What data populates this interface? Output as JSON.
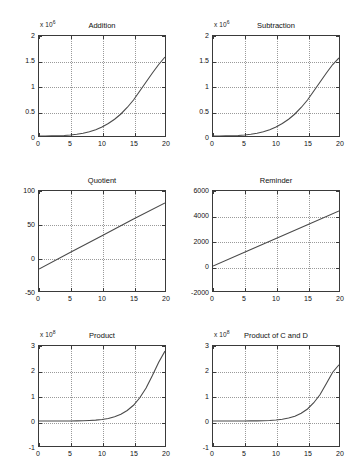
{
  "figure": {
    "background": "#ffffff",
    "axis_color": "#3a3a3a",
    "grid_color": "#9a9a9a",
    "curve_color": "#4a4a4a",
    "rows": 3,
    "cols": 2
  },
  "chart_data": [
    {
      "type": "line",
      "title": "Addition",
      "exponent_prefix": "x 10",
      "exponent_power": "6",
      "xlabel": "",
      "ylabel": "",
      "xlim": [
        0,
        20
      ],
      "ylim": [
        0,
        2
      ],
      "xticks": [
        "0",
        "5",
        "10",
        "15",
        "20"
      ],
      "xtick_values": [
        0,
        5,
        10,
        15,
        20
      ],
      "yticks": [
        "0",
        "0.5",
        "1",
        "1.5",
        "2"
      ],
      "ytick_values": [
        0,
        0.5,
        1,
        1.5,
        2
      ],
      "grid": true,
      "legend": "none",
      "x": [
        0,
        1,
        2,
        3,
        4,
        5,
        6,
        7,
        8,
        9,
        10,
        11,
        12,
        13,
        14,
        15,
        16,
        17,
        18,
        19,
        20
      ],
      "values": [
        0,
        0.0005,
        0.002,
        0.005,
        0.011,
        0.02,
        0.035,
        0.056,
        0.085,
        0.125,
        0.18,
        0.25,
        0.335,
        0.44,
        0.57,
        0.72,
        0.9,
        1.08,
        1.26,
        1.43,
        1.58
      ]
    },
    {
      "type": "line",
      "title": "Subtraction",
      "exponent_prefix": "x 10",
      "exponent_power": "6",
      "xlabel": "",
      "ylabel": "",
      "xlim": [
        0,
        20
      ],
      "ylim": [
        0,
        2
      ],
      "xticks": [
        "0",
        "5",
        "10",
        "15",
        "20"
      ],
      "xtick_values": [
        0,
        5,
        10,
        15,
        20
      ],
      "yticks": [
        "0",
        "0.5",
        "1",
        "1.5",
        "2"
      ],
      "ytick_values": [
        0,
        0.5,
        1,
        1.5,
        2
      ],
      "grid": true,
      "legend": "none",
      "x": [
        0,
        1,
        2,
        3,
        4,
        5,
        6,
        7,
        8,
        9,
        10,
        11,
        12,
        13,
        14,
        15,
        16,
        17,
        18,
        19,
        20
      ],
      "values": [
        0,
        0.0005,
        0.002,
        0.005,
        0.011,
        0.02,
        0.035,
        0.056,
        0.085,
        0.125,
        0.18,
        0.25,
        0.335,
        0.44,
        0.57,
        0.72,
        0.9,
        1.08,
        1.26,
        1.43,
        1.56
      ]
    },
    {
      "type": "line",
      "title": "Quotient",
      "exponent_prefix": "",
      "exponent_power": "",
      "xlabel": "",
      "ylabel": "",
      "xlim": [
        0,
        20
      ],
      "ylim": [
        -50,
        100
      ],
      "xticks": [
        "0",
        "5",
        "10",
        "15",
        "20"
      ],
      "xtick_values": [
        0,
        5,
        10,
        15,
        20
      ],
      "yticks": [
        "-50",
        "0",
        "50",
        "100"
      ],
      "ytick_values": [
        -50,
        0,
        50,
        100
      ],
      "grid": true,
      "legend": "none",
      "x": [
        0,
        5,
        10,
        15,
        20
      ],
      "values": [
        -17,
        8,
        33,
        58,
        82
      ]
    },
    {
      "type": "line",
      "title": "Reminder",
      "exponent_prefix": "",
      "exponent_power": "",
      "xlabel": "",
      "ylabel": "",
      "xlim": [
        0,
        20
      ],
      "ylim": [
        -2000,
        6000
      ],
      "xticks": [
        "0",
        "5",
        "10",
        "15",
        "20"
      ],
      "xtick_values": [
        0,
        5,
        10,
        15,
        20
      ],
      "yticks": [
        "-2000",
        "0",
        "2000",
        "4000",
        "6000"
      ],
      "ytick_values": [
        -2000,
        0,
        2000,
        4000,
        6000
      ],
      "grid": true,
      "legend": "none",
      "x": [
        0,
        5,
        10,
        15,
        20
      ],
      "values": [
        0,
        1100,
        2200,
        3300,
        4400
      ]
    },
    {
      "type": "line",
      "title": "Product",
      "exponent_prefix": "x 10",
      "exponent_power": "8",
      "xlabel": "",
      "ylabel": "",
      "xlim": [
        0,
        20
      ],
      "ylim": [
        -1,
        3
      ],
      "xticks": [
        "0",
        "5",
        "10",
        "15",
        "20"
      ],
      "xtick_values": [
        0,
        5,
        10,
        15,
        20
      ],
      "yticks": [
        "-1",
        "0",
        "1",
        "2",
        "3"
      ],
      "ytick_values": [
        -1,
        0,
        1,
        2,
        3
      ],
      "grid": true,
      "legend": "none",
      "x": [
        0,
        1,
        2,
        3,
        4,
        5,
        6,
        7,
        8,
        9,
        10,
        11,
        12,
        13,
        14,
        15,
        16,
        17,
        18,
        19,
        20
      ],
      "values": [
        0,
        0,
        0,
        0,
        0.001,
        0.002,
        0.005,
        0.01,
        0.02,
        0.035,
        0.06,
        0.1,
        0.17,
        0.27,
        0.42,
        0.63,
        0.93,
        1.32,
        1.82,
        2.35,
        2.8
      ]
    },
    {
      "type": "line",
      "title": "Product of C and D",
      "exponent_prefix": "x 10",
      "exponent_power": "8",
      "xlabel": "",
      "ylabel": "",
      "xlim": [
        0,
        20
      ],
      "ylim": [
        -1,
        3
      ],
      "xticks": [
        "0",
        "5",
        "10",
        "15",
        "20"
      ],
      "xtick_values": [
        0,
        5,
        10,
        15,
        20
      ],
      "yticks": [
        "-1",
        "0",
        "1",
        "2",
        "3"
      ],
      "ytick_values": [
        -1,
        0,
        1,
        2,
        3
      ],
      "grid": true,
      "legend": "none",
      "x": [
        0,
        1,
        2,
        3,
        4,
        5,
        6,
        7,
        8,
        9,
        10,
        11,
        12,
        13,
        14,
        15,
        16,
        17,
        18,
        19,
        20
      ],
      "values": [
        0,
        0,
        0,
        0,
        0,
        0.001,
        0.003,
        0.006,
        0.012,
        0.022,
        0.04,
        0.07,
        0.12,
        0.19,
        0.31,
        0.48,
        0.73,
        1.06,
        1.5,
        1.95,
        2.25
      ]
    }
  ]
}
